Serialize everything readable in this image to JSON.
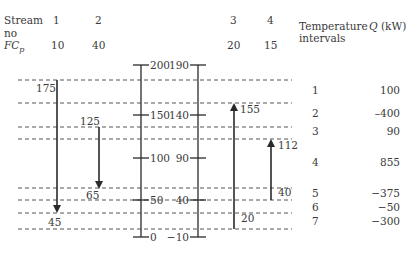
{
  "header": {
    "stream_label": "Stream",
    "no_label": "no",
    "fcp_label": "FC",
    "fcp_sub": "p",
    "temp_intervals_label_1": "Temperature",
    "temp_intervals_label_2": "intervals",
    "q_label_italic": "Q",
    "q_label_unit": " (kW)"
  },
  "streams": [
    {
      "no": "1",
      "fcp": "10",
      "start": "175",
      "end": "45",
      "direction": "down"
    },
    {
      "no": "2",
      "fcp": "40",
      "start": "125",
      "end": "65",
      "direction": "down"
    },
    {
      "no": "3",
      "fcp": "20",
      "start": "20",
      "end": "155",
      "direction": "up"
    },
    {
      "no": "4",
      "fcp": "15",
      "start": "40",
      "end": "112",
      "direction": "up"
    }
  ],
  "hot_axis": {
    "ticks": [
      "200",
      "150",
      "100",
      "50",
      "0"
    ]
  },
  "cold_axis": {
    "ticks": [
      "190",
      "140",
      "90",
      "40",
      "−10"
    ]
  },
  "intervals": [
    {
      "no": "1",
      "q": "100"
    },
    {
      "no": "2",
      "q": "–400"
    },
    {
      "no": "3",
      "q": "90"
    },
    {
      "no": "4",
      "q": "855"
    },
    {
      "no": "5",
      "q": "−375"
    },
    {
      "no": "6",
      "q": "−50"
    },
    {
      "no": "7",
      "q": "−300"
    }
  ],
  "colors": {
    "line": "#2a2a2a",
    "dash": "#555555",
    "text": "#3a3a3a"
  }
}
